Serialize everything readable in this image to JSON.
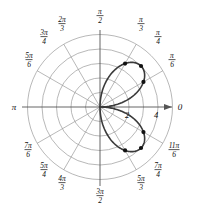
{
  "figure": {
    "type": "polar-plot",
    "background": "#ffffff",
    "grid_color": "#9a9a9a",
    "axis_color": "#555555",
    "curve_color": "#3a3a3a",
    "marker_color": "#111111",
    "width": 200,
    "height": 216
  },
  "axes": {
    "origin": {
      "x": 100,
      "y": 107
    },
    "pixels_per_unit": 14.5,
    "right_axis_label": "0",
    "left_axis_label": "π",
    "radial_ticks": [
      {
        "label": "2",
        "r": 2
      },
      {
        "label": "4",
        "r": 4
      }
    ],
    "grid_circles": [
      1,
      2,
      3,
      4,
      5
    ],
    "spoke_count": 12
  },
  "angle_labels": [
    {
      "name": "pi-over-2",
      "num": "π",
      "den": "2",
      "deg": 90,
      "x": 100,
      "y": 14,
      "anchor": "middle"
    },
    {
      "name": "pi-over-3",
      "num": "π",
      "den": "3",
      "deg": 60,
      "x": 141,
      "y": 22,
      "anchor": "middle"
    },
    {
      "name": "pi-over-4",
      "num": "π",
      "den": "4",
      "deg": 45,
      "x": 158,
      "y": 35,
      "anchor": "middle"
    },
    {
      "name": "pi-over-6",
      "num": "π",
      "den": "6",
      "deg": 30,
      "x": 172,
      "y": 58,
      "anchor": "middle"
    },
    {
      "name": "two-pi-over-3",
      "num": "2π",
      "den": "3",
      "deg": 120,
      "x": 62,
      "y": 22,
      "anchor": "middle"
    },
    {
      "name": "three-pi-over-4",
      "num": "3π",
      "den": "4",
      "deg": 135,
      "x": 44,
      "y": 35,
      "anchor": "middle"
    },
    {
      "name": "five-pi-over-6",
      "num": "5π",
      "den": "6",
      "deg": 150,
      "x": 29,
      "y": 58,
      "anchor": "middle"
    },
    {
      "name": "three-pi-over-2",
      "num": "3π",
      "den": "2",
      "deg": 270,
      "x": 100,
      "y": 194,
      "anchor": "middle"
    },
    {
      "name": "five-pi-over-3",
      "num": "5π",
      "den": "3",
      "deg": 300,
      "x": 141,
      "y": 181,
      "anchor": "middle"
    },
    {
      "name": "seven-pi-over-4",
      "num": "7π",
      "den": "4",
      "deg": 315,
      "x": 158,
      "y": 168,
      "anchor": "middle"
    },
    {
      "name": "eleven-pi-over-6",
      "num": "11π",
      "den": "6",
      "deg": 330,
      "x": 174,
      "y": 148,
      "anchor": "middle"
    },
    {
      "name": "four-pi-over-3",
      "num": "4π",
      "den": "3",
      "deg": 240,
      "x": 62,
      "y": 181,
      "anchor": "middle"
    },
    {
      "name": "five-pi-over-4",
      "num": "5π",
      "den": "4",
      "deg": 225,
      "x": 44,
      "y": 168,
      "anchor": "middle"
    },
    {
      "name": "seven-pi-over-6",
      "num": "7π",
      "den": "6",
      "deg": 210,
      "x": 28,
      "y": 148,
      "anchor": "middle"
    }
  ],
  "chart_data": {
    "type": "line",
    "title": "",
    "xlabel": "",
    "ylabel": "",
    "coordinate_system": "polar",
    "equation": "r = 4 sin(2θ)",
    "rlim": [
      0,
      5
    ],
    "theta_range_deg": [
      0,
      90,
      270,
      360
    ],
    "grid": true,
    "legend": null,
    "petals": [
      {
        "name": "upper-petal",
        "theta_start_deg": 0,
        "theta_end_deg": 90,
        "r_max": 4,
        "r_max_theta_deg": 45
      },
      {
        "name": "lower-petal",
        "theta_start_deg": 270,
        "theta_end_deg": 360,
        "r_max": 4,
        "r_max_theta_deg": 315
      }
    ],
    "marked_points": [
      {
        "theta_deg": 30,
        "r": 3.46
      },
      {
        "theta_deg": 45,
        "r": 4.0
      },
      {
        "theta_deg": 60,
        "r": 3.46
      },
      {
        "theta_deg": 300,
        "r": 3.46
      },
      {
        "theta_deg": 315,
        "r": 4.0
      },
      {
        "theta_deg": 330,
        "r": 3.46
      }
    ]
  }
}
